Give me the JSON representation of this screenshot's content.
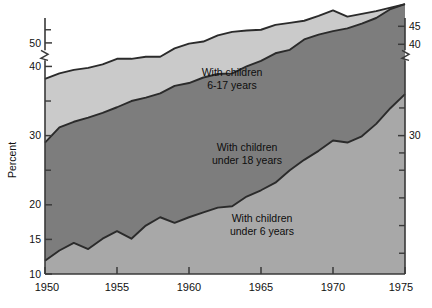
{
  "figure": {
    "background_color": "#ffffff",
    "plot_area": {
      "x": 45,
      "y": 18,
      "width": 360,
      "height": 256
    }
  },
  "chart_data": {
    "type": "area",
    "title": "",
    "subtitle": "",
    "xlabel": "",
    "ylabel": "Percent",
    "stacked": true,
    "grid": false,
    "legend_position": "inline-annotations",
    "x": [
      1950,
      1951,
      1952,
      1953,
      1954,
      1955,
      1956,
      1957,
      1958,
      1959,
      1960,
      1961,
      1962,
      1963,
      1964,
      1965,
      1966,
      1967,
      1968,
      1969,
      1970,
      1971,
      1972,
      1973,
      1974,
      1975
    ],
    "xlim": [
      1950,
      1975
    ],
    "xticks": [
      1950,
      1955,
      1960,
      1965,
      1970,
      1975
    ],
    "xticklabels": [
      "1950",
      "1955",
      "1960",
      "1965",
      "1970",
      "1975"
    ],
    "ylim": [
      10,
      47
    ],
    "yticks_left": [
      10,
      15,
      20,
      30,
      40,
      50
    ],
    "yticklabels_left": [
      "10",
      "15",
      "20",
      "30",
      "40",
      "50"
    ],
    "yticks_right": [
      30,
      40,
      45
    ],
    "yticklabels_right": [
      "30",
      "40",
      "45"
    ],
    "y_axis_break": {
      "between": [
        40,
        50
      ],
      "note": "scale break on left axis above 40; right axis break between 30 and 40"
    },
    "series": [
      {
        "name": "With children under 6 years",
        "color": "#a8a8a8",
        "values": [
          11.9,
          13.4,
          14.5,
          13.6,
          15.1,
          16.2,
          15.1,
          17.0,
          18.2,
          17.4,
          18.2,
          18.9,
          19.6,
          19.8,
          21.2,
          22.1,
          23.2,
          25.0,
          26.5,
          27.8,
          29.3,
          29.0,
          29.9,
          31.7,
          34.0,
          36.0
        ]
      },
      {
        "name": "With children under 18 years",
        "color": "#7d7d7d",
        "values": [
          29.0,
          31.2,
          32.0,
          32.6,
          33.3,
          34.1,
          35.0,
          35.5,
          36.1,
          37.2,
          37.6,
          38.4,
          38.9,
          39.0,
          40.0,
          40.8,
          41.9,
          42.4,
          43.9,
          44.6,
          45.1,
          45.5,
          46.2,
          47.0,
          48.3,
          49.0
        ]
      },
      {
        "name": "With children 6-17 years",
        "color": "#cacaca",
        "values": [
          38.2,
          39.0,
          39.5,
          39.8,
          40.3,
          41.1,
          41.1,
          41.4,
          41.4,
          42.6,
          43.3,
          43.6,
          44.5,
          45.0,
          45.2,
          45.3,
          46.0,
          46.3,
          46.6,
          47.3,
          48.1,
          47.2,
          47.6,
          48.0,
          48.5,
          49.0
        ]
      }
    ],
    "annotations": [
      {
        "text_line1": "With children",
        "text_line2": "6-17 years",
        "x": 1950,
        "y": 0
      },
      {
        "text_line1": "With children",
        "text_line2": "under 18 years",
        "x": 1950,
        "y": 0
      },
      {
        "text_line1": "With children",
        "text_line2": "under 6 years",
        "x": 1950,
        "y": 0
      }
    ]
  },
  "labels": {
    "band_top_line1": "With children",
    "band_top_line2": "6-17 years",
    "band_mid_line1": "With children",
    "band_mid_line2": "under 18 years",
    "band_bot_line1": "With children",
    "band_bot_line2": "under 6 years",
    "y_axis_title": "Percent",
    "x_1950": "1950",
    "x_1955": "1955",
    "x_1960": "1960",
    "x_1965": "1965",
    "x_1970": "1970",
    "x_1975": "1975",
    "yl_10": "10",
    "yl_15": "15",
    "yl_20": "20",
    "yl_30": "30",
    "yl_40": "40",
    "yl_50": "50",
    "yr_30": "30",
    "yr_40": "40",
    "yr_45": "45"
  },
  "colors": {
    "band_top": "#cacaca",
    "band_mid": "#7d7d7d",
    "band_bottom": "#a8a8a8",
    "axis": "#3a3a3a",
    "outline": "#2b2b2b",
    "text": "#111111",
    "page": "#ffffff"
  }
}
